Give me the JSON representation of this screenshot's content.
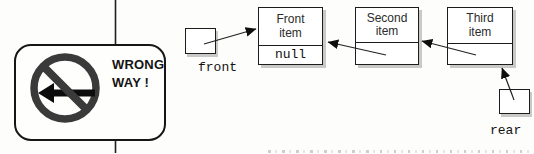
{
  "sign": {
    "line1": "WRONG",
    "line2": "WAY !"
  },
  "list": {
    "front_label": "front",
    "rear_label": "rear",
    "nodes": [
      {
        "title_line1": "Front",
        "title_line2": "item",
        "pointer": "null"
      },
      {
        "title_line1": "Second",
        "title_line2": "item",
        "pointer": ""
      },
      {
        "title_line1": "Third",
        "title_line2": "item",
        "pointer": ""
      }
    ]
  },
  "icons": {
    "no_symbol": "no-entry-prohibition-circle",
    "left_arrow": "left-arrow",
    "pointer_arrows": [
      "front-to-first-node",
      "second-to-first-node",
      "third-to-second-node",
      "rear-to-third-node"
    ]
  },
  "colors": {
    "line_art": "#1f1f1f",
    "prohibition_symbol": "#3a3a3a",
    "arrow_black": "#0c0c0c",
    "box_border": "#1c1c1c",
    "box_shadow": "#c9c9c7",
    "background": "#fdfdfb"
  }
}
